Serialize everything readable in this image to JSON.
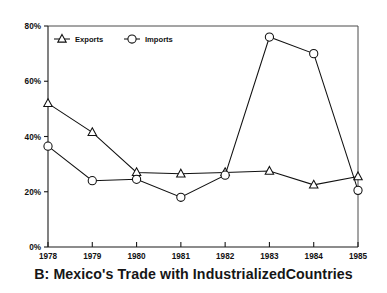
{
  "caption": "B: Mexico's Trade with IndustrializedCountries",
  "legend": {
    "position": "top-left-inside",
    "entries": [
      {
        "label": "Exports",
        "marker": "triangle-marker"
      },
      {
        "label": "Imports",
        "marker": "circle-marker"
      }
    ]
  },
  "axes": {
    "y_ticks": [
      "0%",
      "20%",
      "40%",
      "60%",
      "80%"
    ],
    "x_ticks": [
      "1978",
      "1979",
      "1980",
      "1981",
      "1982",
      "1983",
      "1984",
      "1985"
    ]
  },
  "colors": {
    "line": "#111111",
    "marker_fill": "#ffffff",
    "axis": "#1a1a1a",
    "frame": "#4a4a4a",
    "text": "#111111",
    "background": "#ffffff"
  },
  "chart_data": {
    "type": "line",
    "title": "B: Mexico's Trade with IndustrializedCountries",
    "xlabel": "",
    "ylabel": "",
    "categories": [
      "1978",
      "1979",
      "1980",
      "1981",
      "1982",
      "1983",
      "1984",
      "1985"
    ],
    "series": [
      {
        "name": "Exports",
        "marker": "triangle",
        "values": [
          52.0,
          41.5,
          27.0,
          26.5,
          27.0,
          27.5,
          22.5,
          25.5
        ]
      },
      {
        "name": "Imports",
        "marker": "circle",
        "values": [
          36.5,
          24.0,
          24.5,
          18.0,
          26.0,
          76.0,
          70.0,
          20.5
        ]
      }
    ],
    "ylim": [
      0,
      80
    ],
    "y_tick_values": [
      0,
      20,
      40,
      60,
      80
    ],
    "y_tick_labels": [
      "0%",
      "20%",
      "40%",
      "60%",
      "80%"
    ],
    "grid": false,
    "legend_position": "upper left inside",
    "units": "percent"
  }
}
